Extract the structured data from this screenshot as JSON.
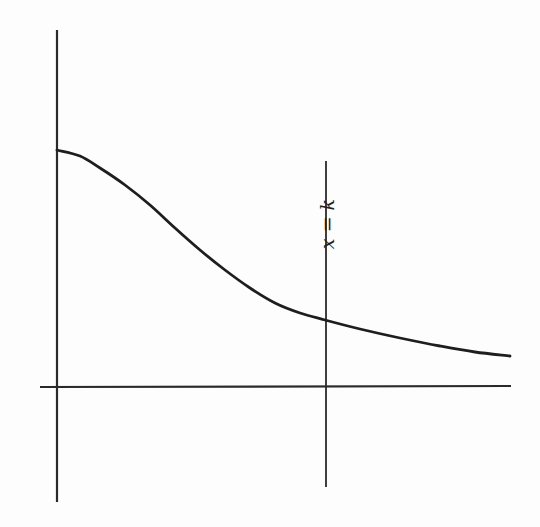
{
  "diagram": {
    "type": "function-graph",
    "line_label": "x = k",
    "colors": {
      "background": "#fdfdfd",
      "ink": "#222222"
    }
  },
  "chart_data": {
    "type": "line",
    "title": "",
    "xlabel": "",
    "ylabel": "",
    "annotations": [
      "x = k"
    ],
    "series": [
      {
        "name": "curve",
        "pixel_points": [
          [
            57,
            150
          ],
          [
            80,
            156
          ],
          [
            100,
            168
          ],
          [
            125,
            185
          ],
          [
            150,
            205
          ],
          [
            175,
            228
          ],
          [
            200,
            250
          ],
          [
            225,
            270
          ],
          [
            250,
            288
          ],
          [
            275,
            303
          ],
          [
            300,
            313
          ],
          [
            325,
            320
          ],
          [
            360,
            329
          ],
          [
            400,
            338
          ],
          [
            440,
            346
          ],
          [
            475,
            352
          ],
          [
            510,
            356
          ]
        ]
      }
    ],
    "vertical_lines": [
      {
        "label": "x = k",
        "x_px": 326
      }
    ],
    "grid": false,
    "legend": null
  }
}
